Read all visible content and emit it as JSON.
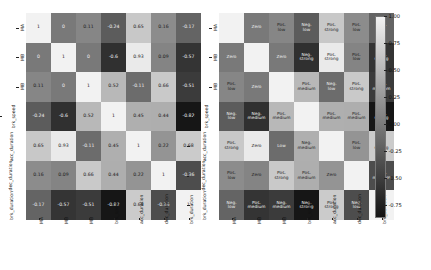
{
  "chart_data": {
    "type": "heatmap",
    "title": "",
    "variables": [
      "MA",
      "MB",
      "MB",
      "brk_speed",
      "acc_duration",
      "dec_duration",
      "brk_duration"
    ],
    "xlabel": "",
    "ylabel": "",
    "colorbar": {
      "ticks": [
        "1.00",
        "0.75",
        "0.50",
        "0.25",
        "0.00",
        "-0.25",
        "-0.50",
        "-0.75"
      ],
      "vmin": -0.85,
      "vmax": 1.0,
      "colormap": "grayscale"
    },
    "panels": [
      {
        "name": "correlation-values",
        "annotation_type": "numeric",
        "rows": [
          {
            "label": "MA",
            "values": [
              1,
              0,
              0.11,
              -0.24,
              0.65,
              0.16,
              -0.17
            ]
          },
          {
            "label": "MB",
            "values": [
              0,
              1,
              0,
              -0.6,
              0.93,
              0.09,
              -0.57
            ]
          },
          {
            "label": "MB",
            "values": [
              0.11,
              0,
              1,
              0.52,
              -0.11,
              0.66,
              -0.51
            ]
          },
          {
            "label": "brk_speed",
            "values": [
              -0.24,
              -0.6,
              0.52,
              1,
              0.45,
              0.44,
              -0.82
            ]
          },
          {
            "label": "acc_duration",
            "values": [
              0.65,
              0.93,
              -0.11,
              0.45,
              1,
              0.22,
              0.68
            ]
          },
          {
            "label": "dec_duration",
            "values": [
              0.16,
              0.09,
              0.66,
              0.44,
              0.22,
              1,
              -0.36
            ]
          },
          {
            "label": "brk_duration",
            "values": [
              -0.17,
              -0.57,
              -0.51,
              -0.82,
              0.68,
              -0.36,
              1
            ]
          }
        ],
        "labels": [
          [
            "",
            "Zero",
            "Pos. low",
            "Neg. low",
            "Pos. strong",
            "Pos. low",
            "Neg. low"
          ],
          [
            "Zero",
            "",
            "Zero",
            "Neg. strong",
            "Pos. strong",
            "Pos. low",
            "Neg. strong"
          ],
          [
            "Pos. low",
            "Zero",
            "",
            "Pos. medium",
            "Neg. low",
            "Pos. strong",
            "Neg. medium"
          ],
          [
            "Neg. low",
            "Neg. medium",
            "Pos. medium",
            "",
            "Pos. medium",
            "Pos. medium",
            "Neg. strong"
          ],
          [
            "Pos. strong",
            "Zero",
            "Low",
            "Neg. medium",
            "",
            "Pos. low",
            "Pos. strong"
          ],
          [
            "Pos. low",
            "Zero",
            "Pos. strong",
            "Pos. medium",
            "Zero",
            "",
            "Neg. medium"
          ],
          [
            "Neg. low",
            "Pos. medium",
            "Neg. medium",
            "Neg. strong",
            "Pos. strong",
            "Neg. low",
            ""
          ]
        ]
      },
      {
        "name": "correlation-strength-labels",
        "annotation_type": "categorical"
      }
    ]
  },
  "axes": {
    "left_panel": {
      "y_ticks": [
        "MA",
        "MB",
        "MB",
        "brk_speed",
        "acc_duration",
        "dec_duration",
        "brk_duration"
      ],
      "x_ticks": [
        "MA",
        "MB",
        "MB",
        "brk_speed",
        "acc_duration",
        "dec_duration",
        "brk_duration"
      ]
    },
    "right_panel": {
      "y_ticks": [
        "MA",
        "MB",
        "MB",
        "brk_speed",
        "acc_duration",
        "dec_duration",
        "brk_duration"
      ],
      "x_ticks": [
        "MA",
        "MB",
        "MB",
        "brk_speed",
        "acc_duration",
        "dec_duration",
        "brk_duration"
      ]
    }
  },
  "colorbar": {
    "ticks": [
      "1.00",
      "0.75",
      "0.50",
      "0.25",
      "0.00",
      "-0.25",
      "-0.50",
      "-0.75"
    ]
  }
}
